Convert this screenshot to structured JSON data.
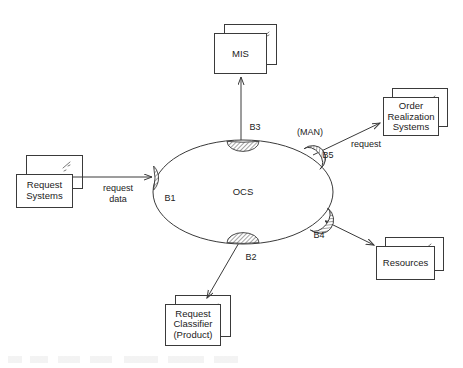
{
  "diagram": {
    "type": "component-port-diagram",
    "center": {
      "label": "OCS",
      "shape": "ellipse",
      "cx": 243,
      "cy": 192,
      "rx": 90,
      "ry": 52
    },
    "ports": [
      {
        "id": "B1",
        "label": "B1",
        "x": 155,
        "y": 178,
        "label_x": 170,
        "label_y": 199,
        "orientation": "left"
      },
      {
        "id": "B2",
        "label": "B2",
        "x": 243,
        "y": 238,
        "label_x": 250,
        "label_y": 258,
        "orientation": "bottom"
      },
      {
        "id": "B3",
        "label": "B3",
        "x": 243,
        "y": 145,
        "label_x": 254,
        "label_y": 128,
        "orientation": "top"
      },
      {
        "id": "B4",
        "label": "B4",
        "x": 320,
        "y": 219,
        "label_x": 320,
        "label_y": 235,
        "orientation": "lower-right"
      },
      {
        "id": "B5",
        "label": "B5",
        "x": 312,
        "y": 158,
        "label_x": 327,
        "label_y": 155,
        "orientation": "upper-right"
      }
    ],
    "nodes": [
      {
        "id": "mis",
        "lines": [
          "MIS"
        ],
        "box": {
          "x": 214,
          "y": 33,
          "w": 52,
          "h": 40
        },
        "shadow": {
          "x": 224,
          "y": 24,
          "w": 52,
          "h": 40
        }
      },
      {
        "id": "order-realization-systems",
        "lines": [
          "Order",
          "Realization",
          "Systems"
        ],
        "box": {
          "x": 383,
          "y": 97,
          "w": 55,
          "h": 38
        },
        "shadow": {
          "x": 392,
          "y": 88,
          "w": 55,
          "h": 38
        }
      },
      {
        "id": "resources",
        "lines": [
          "Resources"
        ],
        "box": {
          "x": 376,
          "y": 246,
          "w": 58,
          "h": 33
        },
        "shadow": {
          "x": 385,
          "y": 237,
          "w": 58,
          "h": 33
        }
      },
      {
        "id": "request-classifier",
        "lines": [
          "Request",
          "Classifier",
          "(Product)"
        ],
        "box": {
          "x": 165,
          "y": 304,
          "w": 55,
          "h": 41
        },
        "shadow": {
          "x": 175,
          "y": 295,
          "w": 55,
          "h": 41
        }
      },
      {
        "id": "request-systems",
        "lines": [
          "Request",
          "Systems"
        ],
        "box": {
          "x": 16,
          "y": 174,
          "w": 56,
          "h": 33
        },
        "shadow": {
          "x": 26,
          "y": 155,
          "w": 56,
          "h": 33
        }
      }
    ],
    "edges": [
      {
        "id": "request-systems-to-b1",
        "from": "request-systems",
        "to": "B1",
        "label": "request\ndata",
        "label_line1": "request",
        "label_line2": "data",
        "label_x": 118,
        "label_y": 189,
        "arrow": "to-target"
      },
      {
        "id": "b3-to-mis",
        "from": "B3",
        "to": "mis",
        "label": "",
        "arrow": "to-target"
      },
      {
        "id": "b5-to-order-realization-systems",
        "from": "B5",
        "to": "order-realization-systems",
        "label": "request",
        "label_x": 366,
        "label_y": 145,
        "arrow": "to-target"
      },
      {
        "id": "b4-to-resources",
        "from": "B4",
        "to": "resources",
        "label": "",
        "arrow": "both"
      },
      {
        "id": "b2-to-request-classifier",
        "from": "B2",
        "to": "request-classifier",
        "label": "",
        "arrow": "to-target"
      }
    ],
    "annotations": [
      {
        "id": "man",
        "text": "(MAN)",
        "x": 310,
        "y": 133
      }
    ]
  },
  "colors": {
    "stroke": "#3a3a3a",
    "text": "#222222",
    "background": "#ffffff",
    "hatch": "#555555"
  }
}
